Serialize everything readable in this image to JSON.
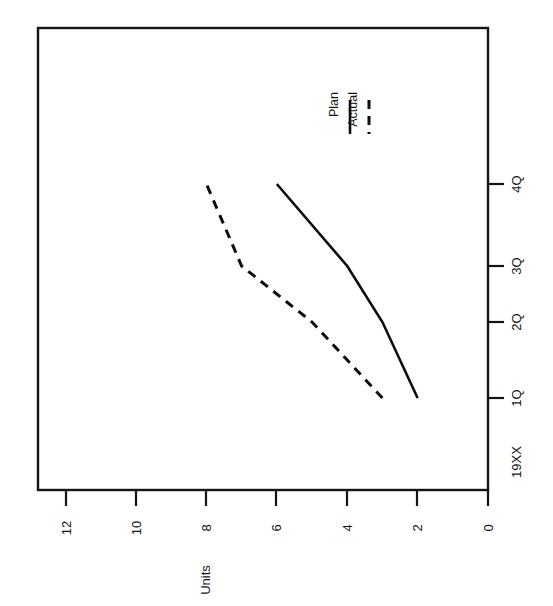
{
  "chart_data": {
    "type": "line",
    "title": "",
    "subtitle": "",
    "orientation": "rotated-90-ccw",
    "xlabel": "19XX",
    "ylabel": "Units",
    "categories": [
      "1Q",
      "2Q",
      "3Q",
      "4Q"
    ],
    "x_tick_labels": [
      "19XX",
      "1Q",
      "2Q",
      "3Q",
      "4Q"
    ],
    "y_tick_labels": [
      "0",
      "2",
      "4",
      "6",
      "8",
      "10",
      "12"
    ],
    "y_ticks": [
      0,
      2,
      4,
      6,
      8,
      10,
      12
    ],
    "ylim": [
      0,
      12
    ],
    "grid": false,
    "legend_position": "top-right",
    "series": [
      {
        "name": "Plan",
        "style": "solid",
        "color": "#0d0d0d",
        "values": [
          2,
          3,
          4,
          6
        ]
      },
      {
        "name": "Actual",
        "style": "dashed",
        "color": "#0d0d0d",
        "values": [
          3,
          5,
          7,
          8
        ]
      }
    ]
  },
  "axes": {
    "y_axis_title": "Units",
    "x_axis_origin_label": "19XX",
    "y_ticks": [
      {
        "label": "12",
        "value": 12
      },
      {
        "label": "10",
        "value": 10
      },
      {
        "label": "8",
        "value": 8
      },
      {
        "label": "6",
        "value": 6
      },
      {
        "label": "4",
        "value": 4
      },
      {
        "label": "2",
        "value": 2
      },
      {
        "label": "0",
        "value": 0
      }
    ],
    "x_ticks": [
      {
        "label": "4Q"
      },
      {
        "label": "3Q"
      },
      {
        "label": "2Q"
      },
      {
        "label": "1Q"
      },
      {
        "label": "19XX"
      }
    ]
  },
  "legend": {
    "entries": [
      {
        "label": "Plan",
        "style": "solid"
      },
      {
        "label": "Actual",
        "style": "dashed"
      }
    ]
  }
}
